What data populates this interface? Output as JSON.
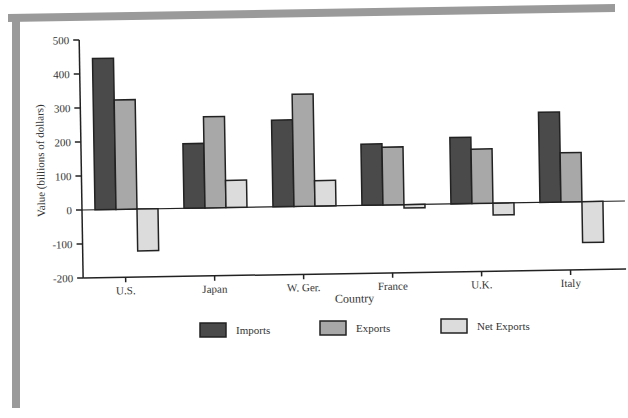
{
  "chart_data": {
    "type": "bar",
    "title": "",
    "xlabel": "Country",
    "ylabel": "Value (billions of dollars)",
    "ylim": [
      -200,
      500
    ],
    "yticks": [
      500,
      400,
      300,
      200,
      100,
      0,
      -100,
      -200
    ],
    "grid": false,
    "legend_position": "bottom",
    "categories": [
      "U.S.",
      "Japan",
      "W. Ger.",
      "France",
      "U.K.",
      "Italy"
    ],
    "series": [
      {
        "name": "Imports",
        "color": "#4a4a4a",
        "values": [
          445,
          190,
          255,
          180,
          195,
          265
        ]
      },
      {
        "name": "Exports",
        "color": "#a8a8a8",
        "values": [
          322,
          268,
          330,
          170,
          160,
          145
        ]
      },
      {
        "name": "Net Exports",
        "color": "#dcdcdc",
        "values": [
          -123,
          80,
          75,
          -10,
          -35,
          -120
        ]
      }
    ]
  },
  "legend": {
    "items": [
      {
        "label": "Imports",
        "color": "#4a4a4a"
      },
      {
        "label": "Exports",
        "color": "#a8a8a8"
      },
      {
        "label": "Net Exports",
        "color": "#dcdcdc"
      }
    ]
  },
  "frame_color": "#9a9a9a"
}
